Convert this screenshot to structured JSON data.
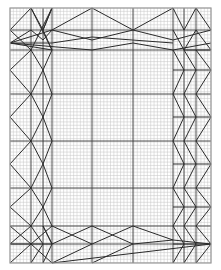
{
  "diagram": {
    "type": "origami-crease-pattern",
    "background": "#ffffff",
    "colors": {
      "minor_grid": "#c4c4c4",
      "major_line": "#3a3a3a",
      "crease": "#2a2a2a",
      "border": "#9a9a9a"
    },
    "paper": {
      "x0": 10,
      "y0": 8,
      "x1": 211,
      "y1": 263
    },
    "minor_grid_step": 3.35,
    "major_verticals": [
      31,
      43,
      52,
      92,
      133,
      173,
      184,
      196
    ],
    "major_horizontals": [
      30,
      50,
      94,
      141,
      188,
      226,
      244
    ],
    "segments": [
      [
        10,
        30,
        31,
        8
      ],
      [
        31,
        8,
        43,
        30
      ],
      [
        43,
        30,
        52,
        8
      ],
      [
        52,
        8,
        43,
        30
      ],
      [
        31,
        8,
        52,
        50
      ],
      [
        52,
        8,
        31,
        50
      ],
      [
        10,
        30,
        31,
        50
      ],
      [
        31,
        50,
        10,
        70
      ],
      [
        10,
        70,
        31,
        94
      ],
      [
        31,
        94,
        10,
        117
      ],
      [
        10,
        117,
        31,
        141
      ],
      [
        31,
        141,
        10,
        164
      ],
      [
        10,
        164,
        31,
        188
      ],
      [
        31,
        188,
        10,
        207
      ],
      [
        10,
        207,
        31,
        226
      ],
      [
        31,
        50,
        43,
        70
      ],
      [
        43,
        70,
        31,
        94
      ],
      [
        31,
        94,
        43,
        117
      ],
      [
        43,
        117,
        31,
        141
      ],
      [
        31,
        141,
        43,
        164
      ],
      [
        43,
        164,
        31,
        188
      ],
      [
        31,
        188,
        43,
        207
      ],
      [
        43,
        207,
        31,
        226
      ],
      [
        43,
        30,
        52,
        50
      ],
      [
        52,
        50,
        43,
        70
      ],
      [
        43,
        70,
        52,
        94
      ],
      [
        52,
        94,
        43,
        117
      ],
      [
        43,
        117,
        52,
        141
      ],
      [
        52,
        141,
        43,
        164
      ],
      [
        43,
        164,
        52,
        188
      ],
      [
        52,
        188,
        43,
        207
      ],
      [
        43,
        207,
        52,
        226
      ],
      [
        43,
        226,
        52,
        244
      ],
      [
        10,
        43,
        31,
        30
      ],
      [
        10,
        43,
        52,
        30
      ],
      [
        10,
        43,
        52,
        50
      ],
      [
        31,
        30,
        43,
        40
      ],
      [
        43,
        40,
        52,
        30
      ],
      [
        52,
        30,
        92,
        8
      ],
      [
        92,
        8,
        133,
        30
      ],
      [
        133,
        30,
        173,
        8
      ],
      [
        52,
        30,
        92,
        40
      ],
      [
        92,
        40,
        133,
        30
      ],
      [
        133,
        30,
        173,
        40
      ],
      [
        173,
        40,
        211,
        30
      ],
      [
        10,
        43,
        92,
        50
      ],
      [
        92,
        50,
        133,
        43
      ],
      [
        133,
        43,
        173,
        50
      ],
      [
        173,
        50,
        211,
        43
      ],
      [
        52,
        43,
        92,
        37
      ],
      [
        92,
        37,
        173,
        43
      ],
      [
        10,
        43,
        52,
        43
      ],
      [
        173,
        8,
        184,
        30
      ],
      [
        184,
        30,
        196,
        8
      ],
      [
        196,
        8,
        211,
        30
      ],
      [
        173,
        30,
        184,
        50
      ],
      [
        184,
        50,
        196,
        30
      ],
      [
        196,
        30,
        211,
        50
      ],
      [
        173,
        50,
        184,
        70
      ],
      [
        184,
        70,
        173,
        94
      ],
      [
        173,
        94,
        184,
        117
      ],
      [
        184,
        117,
        173,
        141
      ],
      [
        173,
        141,
        184,
        164
      ],
      [
        184,
        164,
        173,
        188
      ],
      [
        173,
        188,
        184,
        207
      ],
      [
        184,
        207,
        173,
        226
      ],
      [
        184,
        50,
        196,
        70
      ],
      [
        196,
        70,
        184,
        94
      ],
      [
        184,
        94,
        196,
        117
      ],
      [
        196,
        117,
        184,
        141
      ],
      [
        184,
        141,
        196,
        164
      ],
      [
        196,
        164,
        184,
        188
      ],
      [
        184,
        188,
        196,
        207
      ],
      [
        196,
        207,
        184,
        226
      ],
      [
        196,
        50,
        211,
        70
      ],
      [
        211,
        70,
        196,
        94
      ],
      [
        196,
        94,
        211,
        117
      ],
      [
        211,
        117,
        196,
        141
      ],
      [
        196,
        141,
        211,
        164
      ],
      [
        211,
        164,
        196,
        188
      ],
      [
        196,
        188,
        211,
        207
      ],
      [
        211,
        207,
        196,
        226
      ],
      [
        184,
        50,
        211,
        50
      ],
      [
        173,
        70,
        211,
        70
      ],
      [
        173,
        117,
        211,
        117
      ],
      [
        173,
        164,
        211,
        164
      ],
      [
        173,
        207,
        211,
        207
      ],
      [
        10,
        226,
        31,
        244
      ],
      [
        31,
        244,
        10,
        263
      ],
      [
        31,
        226,
        43,
        244
      ],
      [
        43,
        244,
        31,
        263
      ],
      [
        43,
        226,
        52,
        244
      ],
      [
        52,
        244,
        43,
        263
      ],
      [
        31,
        244,
        52,
        226
      ],
      [
        31,
        244,
        52,
        263
      ],
      [
        10,
        244,
        31,
        226
      ],
      [
        10,
        244,
        52,
        244
      ],
      [
        52,
        226,
        92,
        244
      ],
      [
        92,
        244,
        52,
        263
      ],
      [
        52,
        244,
        92,
        226
      ],
      [
        92,
        226,
        133,
        244
      ],
      [
        92,
        244,
        133,
        226
      ],
      [
        133,
        226,
        173,
        240
      ],
      [
        133,
        244,
        173,
        240
      ],
      [
        173,
        240,
        211,
        244
      ],
      [
        52,
        263,
        211,
        244
      ],
      [
        92,
        263,
        133,
        244
      ],
      [
        173,
        226,
        184,
        244
      ],
      [
        184,
        244,
        173,
        263
      ],
      [
        184,
        226,
        196,
        244
      ],
      [
        196,
        244,
        184,
        263
      ],
      [
        196,
        226,
        211,
        244
      ],
      [
        211,
        244,
        196,
        263
      ],
      [
        173,
        244,
        211,
        244
      ]
    ]
  }
}
